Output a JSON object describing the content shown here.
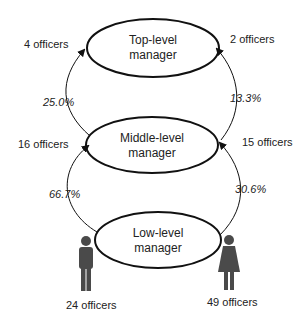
{
  "nodes": {
    "top": {
      "line1": "Top-level",
      "line2": "manager"
    },
    "middle": {
      "line1": "Middle-level",
      "line2": "manager"
    },
    "low": {
      "line1": "Low-level",
      "line2": "manager"
    }
  },
  "left": {
    "top_count": "4 officers",
    "top_pct": "25.0%",
    "middle_count": "16 officers",
    "middle_pct": "66.7%",
    "base_count": "24 officers",
    "icon": "male-figure-icon"
  },
  "right": {
    "top_count": "2 officers",
    "top_pct": "13.3%",
    "middle_count": "15 officers",
    "middle_pct": "30.6%",
    "base_count": "49 officers",
    "icon": "female-figure-icon"
  },
  "colors": {
    "stroke": "#111111",
    "figure": "#4a4a4a",
    "text": "#222222"
  }
}
